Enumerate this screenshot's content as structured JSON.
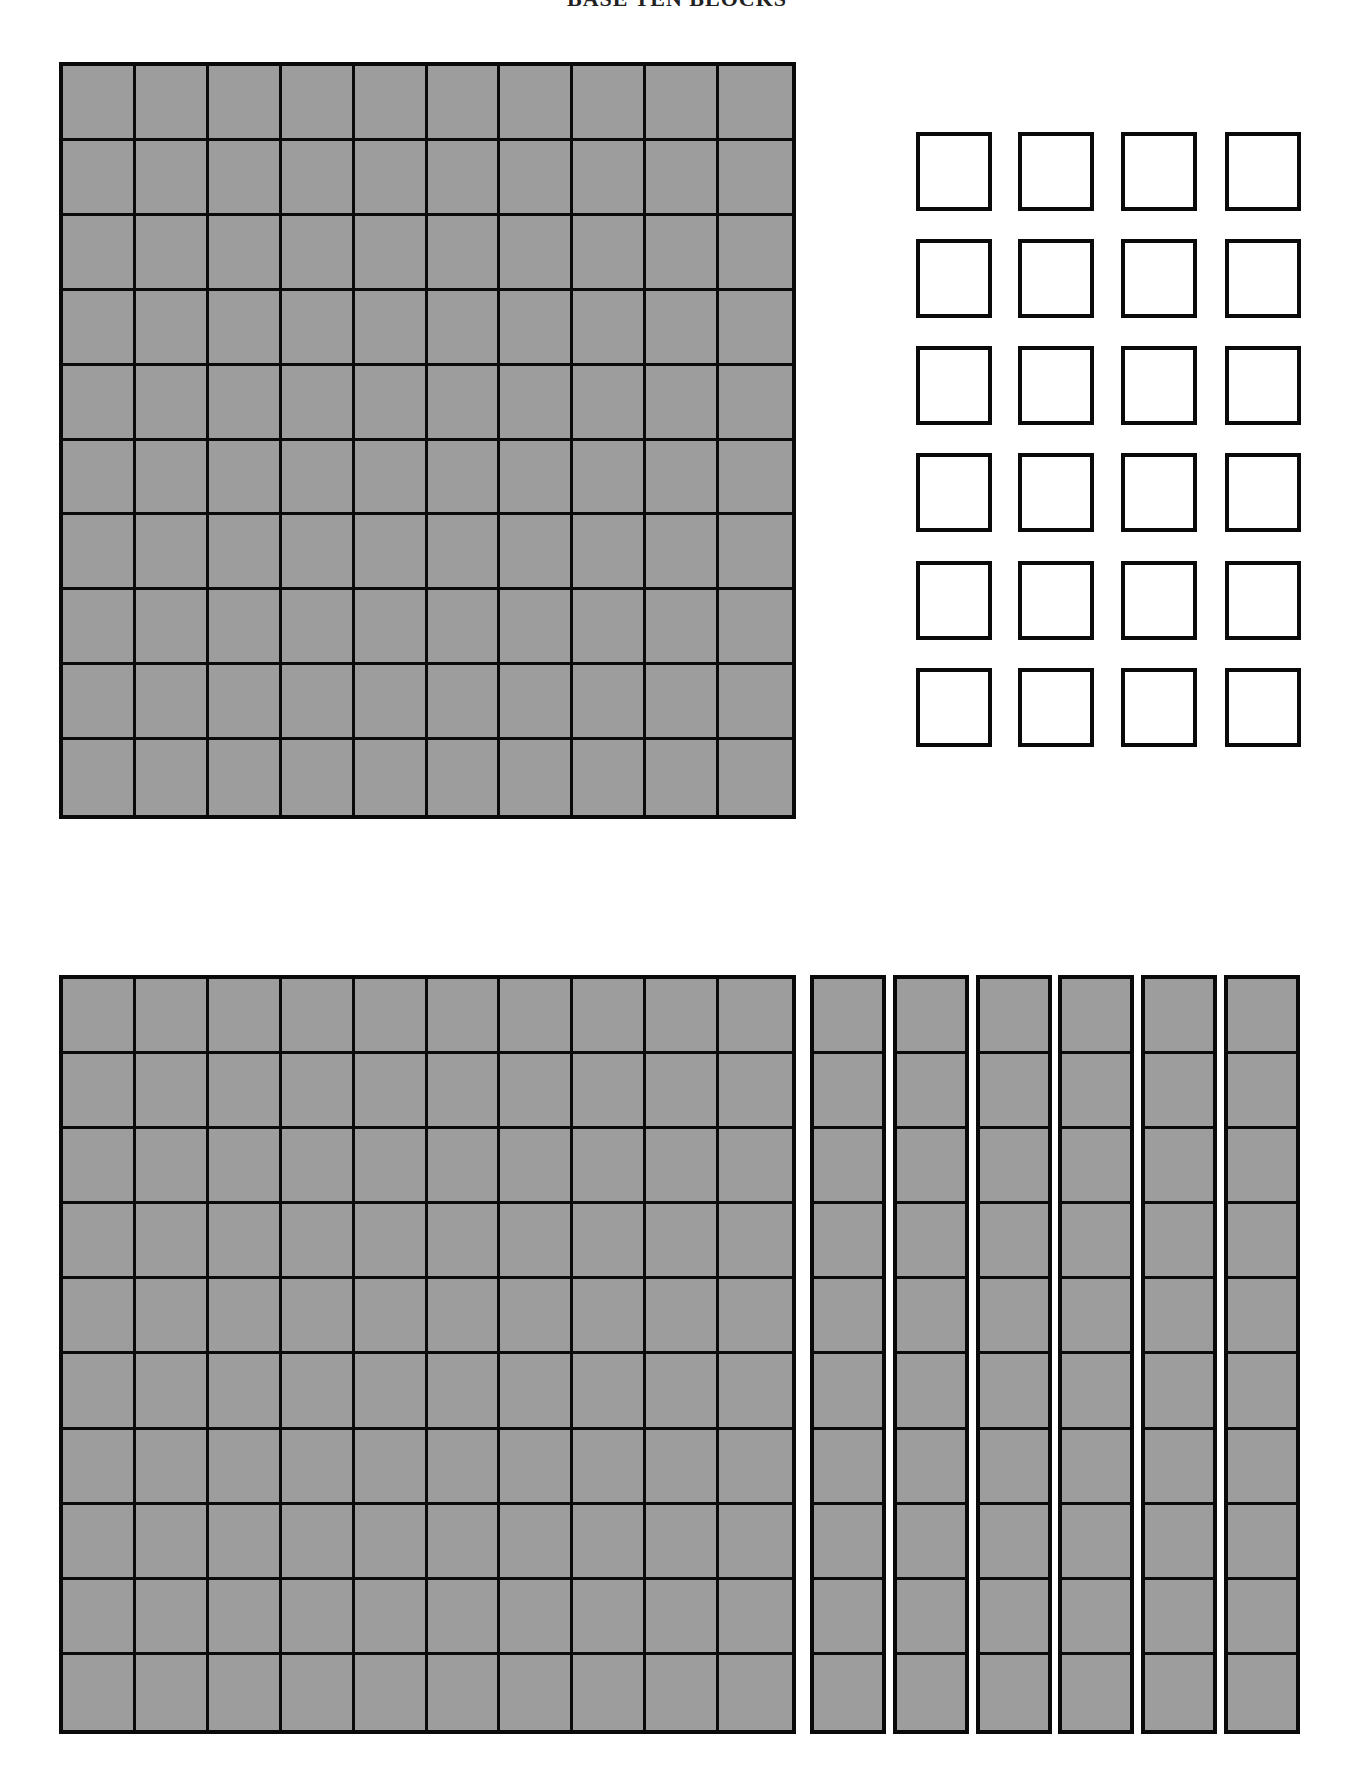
{
  "page": {
    "header_title": "BASE TEN BLOCKS",
    "page_number": ""
  },
  "colors": {
    "block_fill": "#9d9d9d",
    "outline": "#0a0a0a",
    "unit_fill": "#ffffff"
  },
  "blocks": {
    "top_flat": {
      "type": "hundreds-flat",
      "rows": 10,
      "cols": 10,
      "x": 59,
      "y": 62,
      "w": 737,
      "h": 757
    },
    "units": {
      "type": "units",
      "count": 24,
      "rows": 6,
      "cols": 4,
      "col_x": [
        916,
        1018,
        1121,
        1225
      ],
      "row_y": [
        132,
        239,
        346,
        453,
        561,
        668
      ]
    },
    "bottom_flat": {
      "type": "hundreds-flat",
      "rows": 10,
      "cols": 10,
      "x": 59,
      "y": 975,
      "w": 737,
      "h": 759
    },
    "rods": {
      "type": "tens-rods",
      "count": 6,
      "cells_per_rod": 10,
      "x": [
        810,
        893,
        976,
        1058,
        1141,
        1224
      ],
      "y": 975,
      "w": 76,
      "h": 759
    }
  }
}
